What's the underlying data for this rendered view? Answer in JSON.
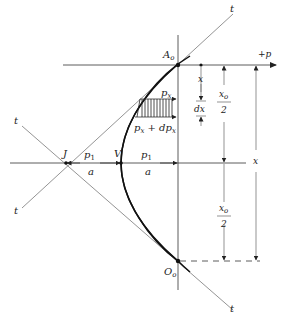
{
  "figure": {
    "points": {
      "A0": "A",
      "A0_sub": "o",
      "O0": "O",
      "O0_sub": "o",
      "J": "J",
      "V": "V"
    },
    "tangent_labels": {
      "top_right": "t",
      "top_left": "t",
      "bottom_left": "t",
      "bottom_right": "t"
    },
    "axis_label": "+p",
    "pressure_labels": {
      "px": "p",
      "px_sub": "x",
      "px_dpx": "p",
      "px_dpx_sub1": "x",
      "px_dpx_plus": " + dp",
      "px_dpx_sub2": "x"
    },
    "ratio_left": {
      "num": "p",
      "num_sub": "1",
      "den": "a"
    },
    "ratio_right": {
      "num": "p",
      "num_sub": "1",
      "den": "a"
    },
    "dimensions": {
      "x_small": "x",
      "dx": "dx",
      "x0_half_top": {
        "num": "x",
        "num_sub": "o",
        "den": "2"
      },
      "x0_half_bottom": {
        "num": "x",
        "num_sub": "o",
        "den": "2"
      },
      "x_total": "x"
    }
  }
}
